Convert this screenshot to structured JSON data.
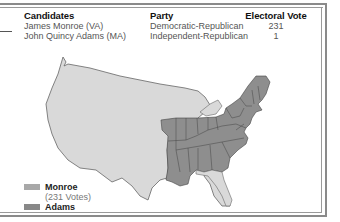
{
  "table": {
    "headers": {
      "candidates": "Candidates",
      "party": "Party",
      "electoral_vote": "Electoral Vote"
    },
    "rows": [
      {
        "candidate": "James Monroe (VA)",
        "party": "Democratic-Republican",
        "votes": "231"
      },
      {
        "candidate": "John Quincy Adams (MA)",
        "party": "Independent-Republican",
        "votes": "1"
      }
    ]
  },
  "legend": {
    "items": [
      {
        "label": "Monroe",
        "sublabel": "(231 Votes)",
        "color": "#a8a8a8"
      },
      {
        "label": "Adams",
        "color": "#888888"
      }
    ]
  },
  "map": {
    "territory_color": "#d9d9d9",
    "states_color": "#8e8e8e",
    "border_color": "#555555"
  }
}
